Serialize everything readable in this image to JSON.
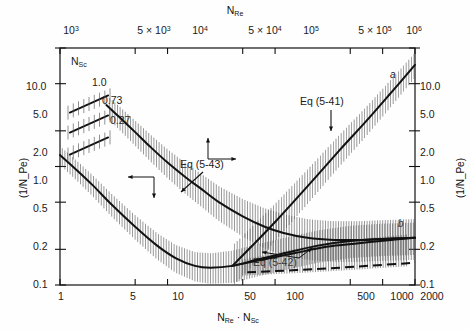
{
  "figure": {
    "background": "#fefefe",
    "ink": "#111111",
    "hatch_color": "#555555"
  },
  "axes": {
    "top": {
      "title": "N",
      "title_sub": "Re",
      "ticks": [
        {
          "label_main": "10",
          "label_sup": "3",
          "prefix": "",
          "pos": 1
        },
        {
          "label_main": "10",
          "label_sup": "3",
          "prefix": "5 × ",
          "pos": 5
        },
        {
          "label_main": "10",
          "label_sup": "4",
          "prefix": "",
          "pos": 10
        },
        {
          "label_main": "10",
          "label_sup": "4",
          "prefix": "5 × ",
          "pos": 50
        },
        {
          "label_main": "10",
          "label_sup": "5",
          "prefix": "",
          "pos": 100
        },
        {
          "label_main": "10",
          "label_sup": "5",
          "prefix": "5 × ",
          "pos": 500
        },
        {
          "label_main": "10",
          "label_sup": "6",
          "prefix": "",
          "pos": 1000
        }
      ]
    },
    "bottom": {
      "title_parts": [
        "N",
        "Re",
        " · ",
        "N",
        "Sc"
      ],
      "title_plain": "N_Re · N_Sc",
      "ticks": [
        "1",
        "5",
        "10",
        "50",
        "100",
        "500",
        "1000",
        "2000"
      ],
      "range": [
        1,
        2000
      ],
      "scale": "log"
    },
    "left": {
      "title_plain": "(1/N_Pe)",
      "ticks": [
        "10.0",
        "5.0",
        "2.0",
        "1.0",
        "0.5",
        "0.2",
        "0.1"
      ],
      "range": [
        0.1,
        10.0
      ],
      "scale": "log"
    },
    "right": {
      "title_plain": "(1/N_Pe)",
      "ticks": [
        "10.0",
        "5.0",
        "2.0",
        "1.0",
        "0.5",
        "0.2",
        "0.1"
      ],
      "range": [
        0.1,
        10.0
      ],
      "scale": "log"
    }
  },
  "annotations": {
    "nsc_header": "N",
    "nsc_header_sub": "Sc",
    "nsc_values": [
      "1.0",
      "0.73",
      "0.27"
    ],
    "eq_5_41": "Eq (5-41)",
    "eq_5_42": "Eq (5-42)",
    "eq_5_43": "Eq (5-43)",
    "curve_a": "a",
    "curve_b": "b"
  },
  "chart_data": {
    "type": "line",
    "title": "",
    "xlabel": "N_Re · N_Sc",
    "ylabel": "(1/N_Pe)",
    "xscale": "log",
    "yscale": "log",
    "xlim": [
      1,
      2000
    ],
    "ylim": [
      0.1,
      10.0
    ],
    "grid": false,
    "legend": "none",
    "secondary_xaxis": {
      "label": "N_Re",
      "range": [
        1000,
        2000000
      ]
    },
    "secondary_yaxis": {
      "label": "(1/N_Pe)",
      "range": [
        0.1,
        10.0
      ]
    },
    "series": [
      {
        "name": "Eq (5-43) upper band curve",
        "annotation": "Eq (5-43)",
        "style": "solid",
        "x": [
          2.7,
          3.5,
          5,
          7,
          10,
          15,
          20,
          30,
          50,
          80,
          120,
          200,
          350,
          600,
          1000,
          2000
        ],
        "y": [
          3.3,
          2.65,
          1.95,
          1.45,
          1.08,
          0.8,
          0.66,
          0.5,
          0.38,
          0.31,
          0.275,
          0.25,
          0.24,
          0.24,
          0.245,
          0.25
        ]
      },
      {
        "name": "lower band curve",
        "style": "solid",
        "x": [
          1,
          1.4,
          2,
          3,
          5,
          8,
          12,
          18,
          25,
          40,
          70,
          120,
          250,
          500,
          1000,
          2000
        ],
        "y": [
          1.25,
          0.95,
          0.7,
          0.48,
          0.31,
          0.215,
          0.168,
          0.145,
          0.14,
          0.145,
          0.165,
          0.185,
          0.215,
          0.235,
          0.245,
          0.25
        ]
      },
      {
        "name": "curve a",
        "annotation": "Eq (5-41)",
        "label": "a",
        "style": "solid",
        "x": [
          40,
          60,
          100,
          200,
          400,
          700,
          1200,
          2000
        ],
        "y": [
          0.145,
          0.21,
          0.34,
          0.68,
          1.38,
          2.4,
          4.2,
          7.2
        ]
      },
      {
        "name": "curve b",
        "label": "b",
        "style": "solid",
        "x": [
          40,
          80,
          150,
          300,
          600,
          1200,
          2000
        ],
        "y": [
          0.145,
          0.165,
          0.185,
          0.21,
          0.225,
          0.24,
          0.25
        ]
      },
      {
        "name": "Eq (5-42) dashed line",
        "annotation": "Eq (5-42)",
        "style": "dashed",
        "x": [
          55,
          100,
          200,
          400,
          800,
          1600,
          2000
        ],
        "y": [
          0.128,
          0.131,
          0.135,
          0.14,
          0.146,
          0.152,
          0.155
        ]
      }
    ],
    "nsc_tick_marks": [
      {
        "label": "1.0",
        "x": 1.45,
        "y": 5.7
      },
      {
        "label": "0.73",
        "x": 1.45,
        "y": 3.6
      },
      {
        "label": "0.27",
        "x": 1.45,
        "y": 2.0
      }
    ]
  }
}
